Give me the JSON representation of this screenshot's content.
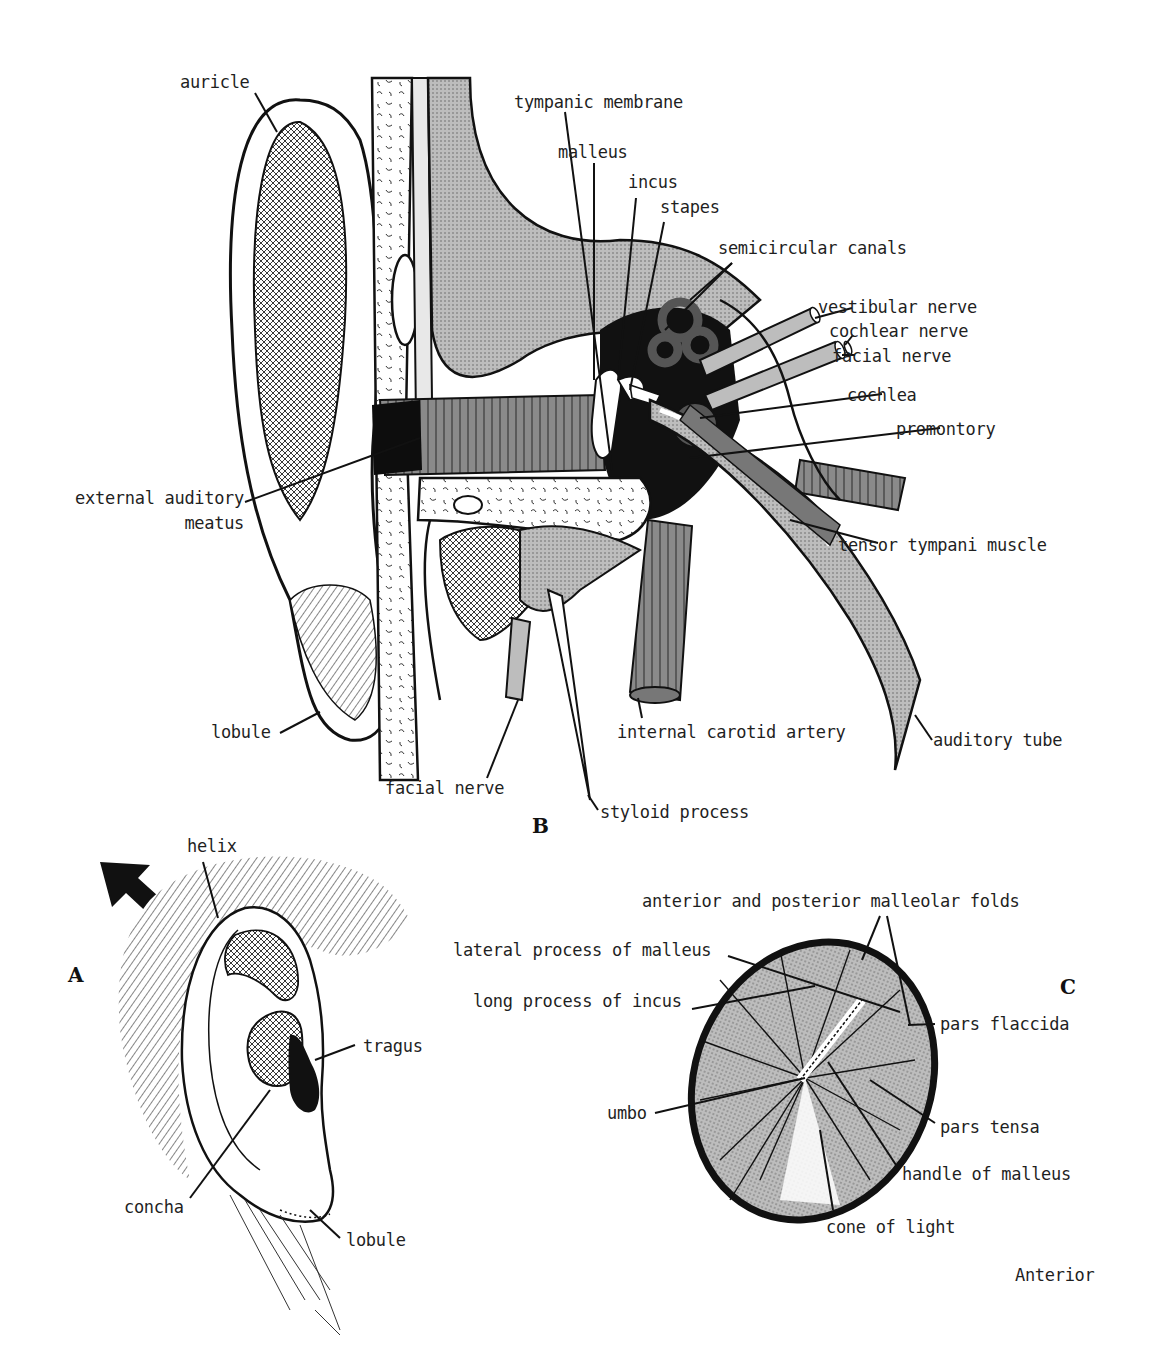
{
  "figure": {
    "panels": [
      {
        "id": "A",
        "letter": "A",
        "description": "External ear (lateral view)"
      },
      {
        "id": "B",
        "letter": "B",
        "description": "Coronal section through external, middle and inner ear"
      },
      {
        "id": "C",
        "letter": "C",
        "description": "Tympanic membrane (otoscopic view)"
      }
    ]
  },
  "panel_b": {
    "letter": "B",
    "labels": {
      "auricle": "auricle",
      "tympanic_membrane": "tympanic membrane",
      "malleus": "malleus",
      "incus": "incus",
      "stapes": "stapes",
      "semicircular_canals": "semicircular canals",
      "vestibular_nerve": "vestibular nerve",
      "cochlear_nerve": "cochlear nerve",
      "facial_nerve_right": "facial nerve",
      "cochlea": "cochlea",
      "promontory": "promontory",
      "external_auditory_meatus_1": "external auditory",
      "external_auditory_meatus_2": "meatus",
      "tensor_tympani_muscle": "tensor tympani muscle",
      "lobule": "lobule",
      "internal_carotid_artery": "internal carotid artery",
      "auditory_tube": "auditory tube",
      "facial_nerve_bottom": "facial nerve",
      "styloid_process": "styloid process"
    }
  },
  "panel_a": {
    "letter": "A",
    "labels": {
      "helix": "helix",
      "tragus": "tragus",
      "concha": "concha",
      "lobule": "lobule"
    },
    "arrow": "direction-arrow-up-left"
  },
  "panel_c": {
    "letter": "C",
    "labels": {
      "malleolar_folds": "anterior and posterior malleolar folds",
      "lateral_process": "lateral process of malleus",
      "long_process_incus": "long process of incus",
      "pars_flaccida": "pars flaccida",
      "umbo": "umbo",
      "pars_tensa": "pars tensa",
      "handle_of_malleus": "handle of malleus",
      "cone_of_light": "cone of light"
    },
    "orientation": "Anterior"
  }
}
